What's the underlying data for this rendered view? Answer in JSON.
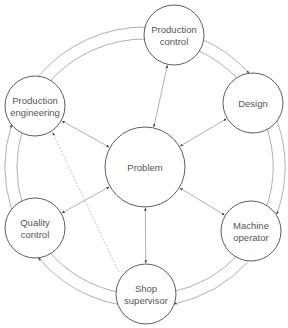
{
  "caption_fragment": "",
  "nodes": [
    {
      "id": "production_control",
      "lines": [
        "Production",
        "control"
      ],
      "cx": 174,
      "cy": 35,
      "r": 30
    },
    {
      "id": "design",
      "lines": [
        "Design"
      ],
      "cx": 253,
      "cy": 103,
      "r": 30
    },
    {
      "id": "production_engineering",
      "lines": [
        "Production",
        "engineering"
      ],
      "cx": 35,
      "cy": 106,
      "r": 30
    },
    {
      "id": "problem",
      "lines": [
        "Problem"
      ],
      "cx": 145,
      "cy": 167,
      "r": 40
    },
    {
      "id": "quality_control",
      "lines": [
        "Quality",
        "control"
      ],
      "cx": 35,
      "cy": 228,
      "r": 30
    },
    {
      "id": "machine_operator",
      "lines": [
        "Machine",
        "operator"
      ],
      "cx": 251,
      "cy": 231,
      "r": 30
    },
    {
      "id": "shop_supervisor",
      "lines": [
        "Shop",
        "supervisor"
      ],
      "cx": 146,
      "cy": 294,
      "r": 30
    }
  ],
  "spoke_edges": [
    {
      "from": "problem",
      "to": "production_control",
      "style": "double-arrow"
    },
    {
      "from": "problem",
      "to": "design",
      "style": "double-arrow"
    },
    {
      "from": "problem",
      "to": "production_engineering",
      "style": "double-arrow"
    },
    {
      "from": "problem",
      "to": "quality_control",
      "style": "double-arrow"
    },
    {
      "from": "problem",
      "to": "machine_operator",
      "style": "double-arrow"
    },
    {
      "from": "problem",
      "to": "shop_supervisor",
      "style": "double-arrow"
    }
  ],
  "ring_edges": [
    {
      "from": "production_engineering",
      "to": "production_control"
    },
    {
      "from": "production_control",
      "to": "production_engineering"
    },
    {
      "from": "production_control",
      "to": "design"
    },
    {
      "from": "design",
      "to": "production_control"
    },
    {
      "from": "design",
      "to": "machine_operator"
    },
    {
      "from": "machine_operator",
      "to": "design"
    },
    {
      "from": "machine_operator",
      "to": "shop_supervisor"
    },
    {
      "from": "shop_supervisor",
      "to": "machine_operator"
    },
    {
      "from": "shop_supervisor",
      "to": "quality_control"
    },
    {
      "from": "quality_control",
      "to": "shop_supervisor"
    },
    {
      "from": "quality_control",
      "to": "production_engineering"
    },
    {
      "from": "production_engineering",
      "to": "quality_control"
    }
  ],
  "dashed_edges": [
    {
      "from": "shop_supervisor",
      "to": "production_engineering",
      "style": "dashed-arrow"
    }
  ],
  "colors": {
    "stroke": "#4a4a4a",
    "edge": "#7a7a7a",
    "text": "#555555",
    "background": "#ffffff"
  }
}
